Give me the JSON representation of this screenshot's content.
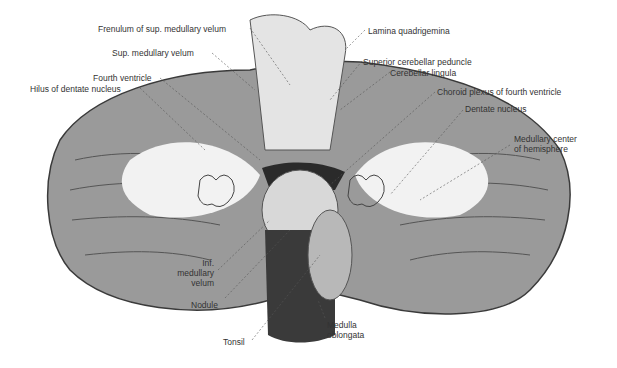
{
  "figure": {
    "labels": {
      "frenulum": "Frenulum of sup. medullary velum",
      "sup_velum": "Sup. medullary velum",
      "fourth_ventricle": "Fourth ventricle",
      "hilus": "Hilus of dentate nucleus",
      "lamina": "Lamina quadrigemina",
      "sup_peduncle": "Superior cerebellar peduncle",
      "lingula": "Cerebellar lingula",
      "choroid": "Choroid plexus of fourth ventricle",
      "dentate": "Dentate nucleus",
      "medullary_center_1": "Medullary center",
      "medullary_center_2": "of hemisphere",
      "inf_velum_1": "Inf.",
      "inf_velum_2": "medullary",
      "inf_velum_3": "velum",
      "nodule": "Nodule",
      "tonsil": "Tonsil",
      "medulla_1": "Medulla",
      "medulla_2": "oblongata"
    },
    "colors": {
      "background": "#ffffff",
      "white_matter": "#f2f2f2",
      "gray_matter": "#9a9a9a",
      "dark": "#3a3a3a",
      "label_text": "#333333"
    }
  }
}
